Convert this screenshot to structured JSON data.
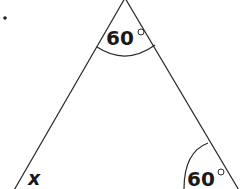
{
  "diagram": {
    "type": "triangle",
    "bullet": "•",
    "angles": {
      "apex": {
        "value": "60",
        "unit": "°"
      },
      "bottom_right": {
        "value": "60",
        "unit": "°"
      },
      "bottom_left": {
        "value": "x"
      }
    },
    "colors": {
      "stroke": "#2a2a2a",
      "text": "#1a1a1a",
      "background": "#ffffff"
    }
  }
}
